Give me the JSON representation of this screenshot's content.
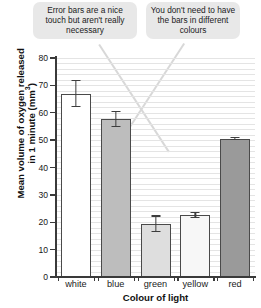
{
  "annotations": [
    {
      "id": "error-bars-note",
      "text": "Error bars are a nice touch but aren't really necessary"
    },
    {
      "id": "bar-colours-note",
      "text": "You don't need to have the bars in different colours"
    }
  ],
  "chart_data": {
    "type": "bar",
    "title": "",
    "xlabel": "Colour of light",
    "ylabel": "Mean volume of oxygen released in 1 minute (mm3)",
    "ylabel_main": "Mean volume of oxygen released",
    "ylabel_sub": "in 1 minute (mm",
    "ylabel_sup": "3",
    "ylabel_close": ")",
    "categories": [
      "white",
      "blue",
      "green",
      "yellow",
      "red"
    ],
    "values": [
      67,
      57.8,
      19.5,
      22.6,
      50.5
    ],
    "errors": [
      5,
      3,
      3,
      1.2,
      0.6
    ],
    "bar_colors": [
      "#ffffff",
      "#bdbdbd",
      "#dedede",
      "#f7f7f7",
      "#9a9a9a"
    ],
    "bar_edge_color": "#4a4a4a",
    "ylim": [
      0,
      80
    ],
    "yticks": [
      0,
      10,
      20,
      30,
      40,
      50,
      60,
      70,
      80
    ],
    "ytick_labels": [
      "0",
      "10",
      "20",
      "30",
      "40",
      "50",
      "60",
      "70",
      "80"
    ],
    "grid": true,
    "grid_step": 2,
    "grid_color": "#e4e4e4",
    "legend": "none"
  }
}
